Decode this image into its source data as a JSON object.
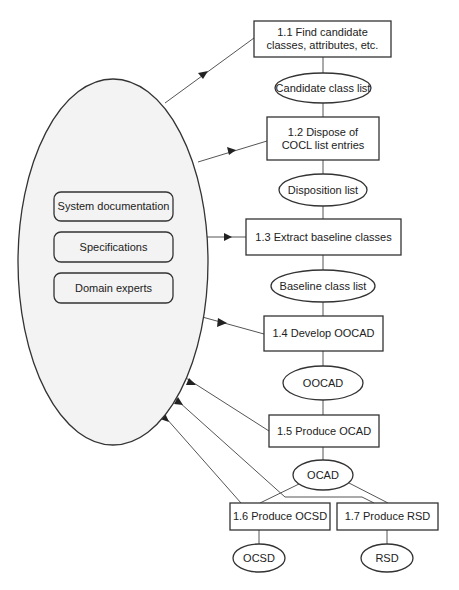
{
  "diagram": {
    "type": "process-flow",
    "colors": {
      "stroke": "#333333",
      "source_fill": "#f3f3f3",
      "background": "#ffffff"
    },
    "source": {
      "label": "information sources",
      "items": [
        {
          "label": "System documentation"
        },
        {
          "label": "Specifications"
        },
        {
          "label": "Domain experts"
        }
      ]
    },
    "processes": [
      {
        "id": "1.1",
        "label": "1.1 Find candidate classes, attributes, etc."
      },
      {
        "id": "1.2",
        "label": "1.2 Dispose of COCL list entries"
      },
      {
        "id": "1.3",
        "label": "1.3 Extract baseline classes"
      },
      {
        "id": "1.4",
        "label": "1.4 Develop OOCAD"
      },
      {
        "id": "1.5",
        "label": "1.5 Produce OCAD"
      },
      {
        "id": "1.6",
        "label": "1.6 Produce OCSD"
      },
      {
        "id": "1.7",
        "label": "1.7 Produce RSD"
      }
    ],
    "artifacts": [
      {
        "label": "Candidate class list"
      },
      {
        "label": "Disposition list"
      },
      {
        "label": "Baseline class list"
      },
      {
        "label": "OOCAD"
      },
      {
        "label": "OCAD"
      },
      {
        "label": "OCSD"
      },
      {
        "label": "RSD"
      }
    ],
    "edges": [
      {
        "from": "sources",
        "to": "1.1",
        "arrow": true
      },
      {
        "from": "1.1",
        "to": "Candidate class list"
      },
      {
        "from": "Candidate class list",
        "to": "1.2"
      },
      {
        "from": "sources",
        "to": "1.2",
        "arrow": true
      },
      {
        "from": "1.2",
        "to": "Disposition list"
      },
      {
        "from": "Disposition list",
        "to": "1.3"
      },
      {
        "from": "sources",
        "to": "1.3",
        "arrow": true
      },
      {
        "from": "1.3",
        "to": "Baseline class list"
      },
      {
        "from": "Baseline class list",
        "to": "1.4"
      },
      {
        "from": "sources",
        "to": "1.4",
        "arrow": true
      },
      {
        "from": "1.4",
        "to": "OOCAD"
      },
      {
        "from": "OOCAD",
        "to": "1.5"
      },
      {
        "from": "sources",
        "to": "1.5",
        "arrow": true
      },
      {
        "from": "1.5",
        "to": "OCAD"
      },
      {
        "from": "OCAD",
        "to": "1.6"
      },
      {
        "from": "OCAD",
        "to": "1.7"
      },
      {
        "from": "sources",
        "to": "1.6",
        "arrow": true
      },
      {
        "from": "sources",
        "to": "1.7",
        "arrow": true
      },
      {
        "from": "1.6",
        "to": "OCSD"
      },
      {
        "from": "1.7",
        "to": "RSD"
      }
    ]
  }
}
